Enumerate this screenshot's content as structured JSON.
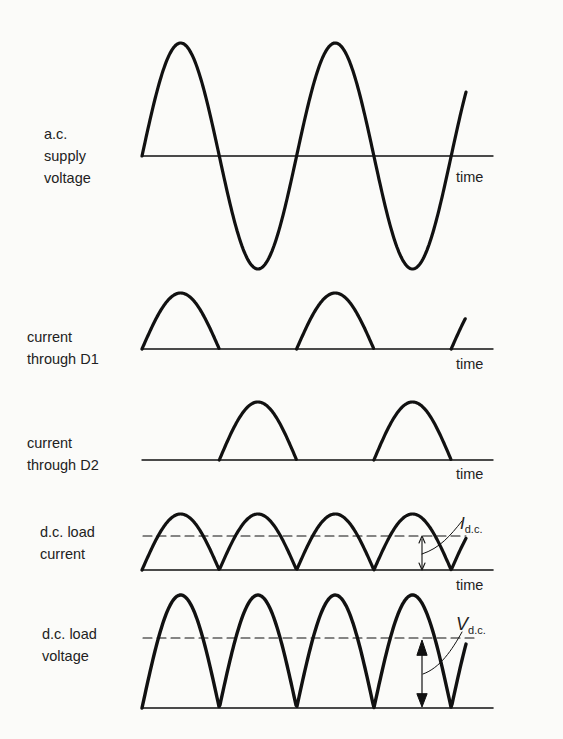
{
  "panels": [
    {
      "id": "ac",
      "label": [
        "a.c.",
        "supply",
        "voltage"
      ],
      "axis": "time"
    },
    {
      "id": "d1",
      "label": [
        "current",
        "through D1"
      ],
      "axis": "time"
    },
    {
      "id": "d2",
      "label": [
        "current",
        "through D2"
      ],
      "axis": "time"
    },
    {
      "id": "dci",
      "label": [
        "d.c. load",
        "current"
      ],
      "axis": "time",
      "annotation": {
        "symbol": "I",
        "subscript": "d.c."
      }
    },
    {
      "id": "dcv",
      "label": [
        "d.c. load",
        "voltage"
      ],
      "annotation": {
        "symbol": "V",
        "subscript": "d.c."
      }
    }
  ],
  "colors": {
    "line": "#111111",
    "background": "#fbfbf9"
  }
}
